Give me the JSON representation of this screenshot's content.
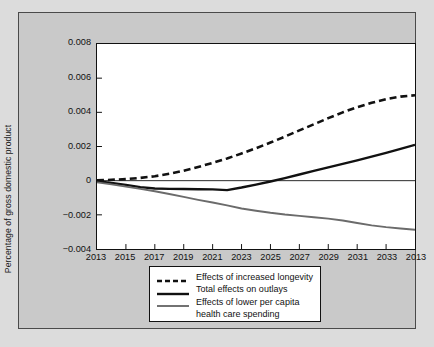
{
  "chart_data": {
    "type": "line",
    "title": "",
    "xlabel": "",
    "ylabel": "Percentage of gross domestic product",
    "xlim": [
      2013,
      2035
    ],
    "ylim": [
      -0.004,
      0.008
    ],
    "grid": false,
    "legend_position": "below-axes",
    "y_ticks": [
      0.008,
      0.006,
      0.004,
      0.002,
      0,
      -0.002,
      -0.004
    ],
    "y_tick_labels": [
      "0.008",
      "0.006",
      "0.004",
      "0.002",
      "0",
      "−0.002",
      "−0.004"
    ],
    "x_ticks": [
      2013,
      2015,
      2017,
      2019,
      2021,
      2023,
      2025,
      2027,
      2029,
      2031,
      2033,
      2035
    ],
    "x_tick_labels": [
      "2013",
      "2015",
      "2017",
      "2019",
      "2021",
      "2023",
      "2025",
      "2027",
      "2029",
      "2031",
      "2033",
      "2013"
    ],
    "x": [
      2013,
      2014,
      2015,
      2016,
      2017,
      2018,
      2019,
      2020,
      2021,
      2022,
      2023,
      2024,
      2025,
      2026,
      2027,
      2028,
      2029,
      2030,
      2031,
      2032,
      2033,
      2034,
      2035
    ],
    "series": [
      {
        "name": "Effects of increased longevity",
        "color": "#111111",
        "style": "dashed",
        "width": 2.6,
        "values": [
          2e-05,
          5e-05,
          9e-05,
          0.00016,
          0.00026,
          0.0004,
          0.00058,
          0.0008,
          0.00104,
          0.0013,
          0.00159,
          0.0019,
          0.00223,
          0.00258,
          0.00294,
          0.0033,
          0.00366,
          0.004,
          0.0043,
          0.00456,
          0.00477,
          0.00492,
          0.005
        ]
      },
      {
        "name": "Total effects on outlays",
        "color": "#111111",
        "style": "solid",
        "width": 2.4,
        "values": [
          -3e-05,
          -0.00013,
          -0.00025,
          -0.00038,
          -0.00046,
          -0.00048,
          -0.00049,
          -0.0005,
          -0.00051,
          -0.00055,
          -0.0004,
          -0.00023,
          -5e-05,
          0.00015,
          0.00036,
          0.00057,
          0.00078,
          0.00098,
          0.00119,
          0.00141,
          0.00163,
          0.00186,
          0.0021
        ]
      },
      {
        "name": "Effects of lower per capita health care spending",
        "color": "#6b6b6b",
        "style": "solid",
        "width": 1.9,
        "values": [
          -0.0001,
          -0.00022,
          -0.00035,
          -0.00048,
          -0.00062,
          -0.00078,
          -0.00095,
          -0.00112,
          -0.00128,
          -0.00145,
          -0.00163,
          -0.00176,
          -0.00188,
          -0.00198,
          -0.00206,
          -0.00214,
          -0.00222,
          -0.00233,
          -0.00248,
          -0.00262,
          -0.00272,
          -0.0028,
          -0.00287
        ]
      }
    ],
    "legend_entries": [
      {
        "label": "Effects of increased longevity",
        "style": "dashed",
        "color": "#111111"
      },
      {
        "label": "Total effects on outlays",
        "style": "solid",
        "color": "#111111"
      },
      {
        "label": "Effects of lower per capita",
        "label_line2": "health care spending",
        "style": "solid",
        "color": "#6b6b6b"
      }
    ],
    "zero_line": {
      "value": 0,
      "color": "#111111",
      "width": 0.9
    }
  },
  "colors": {
    "page_background": "#dcdcdc",
    "panel_background": "#c9c9c9",
    "panel_border": "#4a4a4a",
    "plot_background": "#ffffff",
    "axis": "#111111",
    "gray_series": "#6b6b6b"
  }
}
